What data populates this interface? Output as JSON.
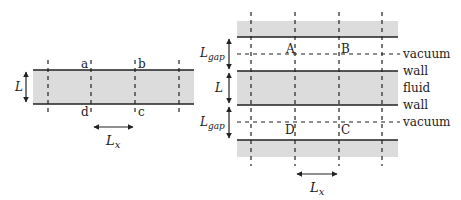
{
  "left_diagram": {
    "corner_labels": {
      "a": "a",
      "b": "b",
      "c": "c",
      "d": "d"
    },
    "height_label": "L",
    "period_label_main": "L",
    "period_label_sub": "x"
  },
  "right_diagram": {
    "corner_labels": {
      "A": "A",
      "B": "B",
      "C": "C",
      "D": "D"
    },
    "gap_label_main": "L",
    "gap_label_sub": "gap",
    "height_label": "L",
    "period_label_main": "L",
    "period_label_sub": "x",
    "region_labels": [
      "vacuum",
      "wall",
      "fluid",
      "wall",
      "vacuum"
    ]
  },
  "colors": {
    "fluid_fill": "#dcdcdc",
    "line": "#222222"
  }
}
